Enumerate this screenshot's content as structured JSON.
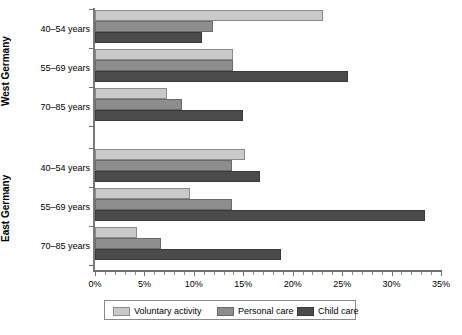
{
  "chart_data": {
    "type": "bar",
    "orientation": "horizontal",
    "title": "",
    "subtitle": "",
    "xlabel": "",
    "ylabel": "",
    "xlim": [
      0,
      35
    ],
    "xunit": "%",
    "grid": false,
    "legend_position": "bottom",
    "panels": [
      {
        "name": "West Germany",
        "categories": [
          "40–54 years",
          "55–69 years",
          "70–85 years"
        ]
      },
      {
        "name": "East Germany",
        "categories": [
          "40–54 years",
          "55–69 years",
          "70–85 years"
        ]
      }
    ],
    "series": [
      {
        "name": "Voluntary activity",
        "color": "#c9c9c9",
        "values": {
          "West Germany": [
            23.1,
            14.0,
            7.3
          ],
          "East Germany": [
            15.2,
            9.6,
            4.2
          ]
        }
      },
      {
        "name": "Personal care",
        "color": "#8d8d8d",
        "values": {
          "West Germany": [
            11.9,
            14.0,
            8.8
          ],
          "East Germany": [
            13.9,
            13.9,
            6.7
          ]
        }
      },
      {
        "name": "Child care",
        "color": "#4b4b4b",
        "values": {
          "West Germany": [
            10.8,
            25.6,
            15.0
          ],
          "East Germany": [
            16.7,
            33.4,
            18.8
          ]
        }
      }
    ],
    "xticks": [
      {
        "value": 0,
        "label": "0%"
      },
      {
        "value": 5,
        "label": "5%"
      },
      {
        "value": 10,
        "label": "10%"
      },
      {
        "value": 15,
        "label": "15%"
      },
      {
        "value": 20,
        "label": "20%"
      },
      {
        "value": 25,
        "label": "25%"
      },
      {
        "value": 30,
        "label": "30%"
      },
      {
        "value": 35,
        "label": "35%"
      }
    ],
    "xticks_minor_step": 1
  },
  "axis": {
    "tick_labels": [
      "0%",
      "5%",
      "10%",
      "15%",
      "20%",
      "25%",
      "30%",
      "35%"
    ]
  },
  "panels": {
    "west": {
      "title": "West Germany",
      "categories": [
        "40–54 years",
        "55–69 years",
        "70–85 years"
      ]
    },
    "east": {
      "title": "East Germany",
      "categories": [
        "40–54 years",
        "55–69 years",
        "70–85 years"
      ]
    }
  },
  "legend": {
    "items": [
      {
        "label": "Voluntary activity",
        "swatch": "voluntary-activity-swatch"
      },
      {
        "label": "Personal care",
        "swatch": "personal-care-swatch"
      },
      {
        "label": "Child care",
        "swatch": "child-care-swatch"
      }
    ]
  },
  "colors": {
    "series_voluntary": "#c9c9c9",
    "series_personal": "#8d8d8d",
    "series_child": "#4b4b4b",
    "axis": "#6f6f6f",
    "background": "#ffffff",
    "text": "#000000"
  }
}
